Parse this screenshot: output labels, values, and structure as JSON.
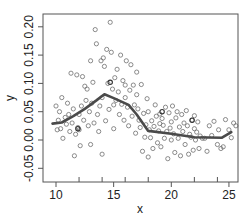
{
  "chart_data": {
    "type": "scatter",
    "title": "",
    "xlabel": "x",
    "ylabel": "y",
    "xlim": [
      9.3,
      26.2
    ],
    "ylim": [
      -0.074,
      0.223
    ],
    "grid": false,
    "legend": null,
    "x_ticks": [
      10,
      15,
      20,
      25
    ],
    "x_tick_labels": [
      "10",
      "15",
      "20",
      "25"
    ],
    "x_minor_ticks": [
      12,
      14,
      16,
      18,
      22,
      24
    ],
    "y_ticks": [
      -0.05,
      0.0,
      0.05,
      0.1,
      0.15,
      0.2
    ],
    "y_tick_labels": [
      "-0.05",
      "0.00",
      "0.05",
      "0.10",
      "0.15",
      "0.20"
    ],
    "series": [
      {
        "name": "observations",
        "kind": "scatter",
        "marker": "open-circle",
        "color": "#6e6e6e",
        "points": [
          [
            10.0,
            0.06
          ],
          [
            10.1,
            0.018
          ],
          [
            10.2,
            0.035
          ],
          [
            10.3,
            0.05
          ],
          [
            10.4,
            0.02
          ],
          [
            10.5,
            0.075
          ],
          [
            10.6,
            0.003
          ],
          [
            10.8,
            0.04
          ],
          [
            10.9,
            0.028
          ],
          [
            11.0,
            0.065
          ],
          [
            11.1,
            0.045
          ],
          [
            11.2,
            0.015
          ],
          [
            11.3,
            0.118
          ],
          [
            11.4,
            0.03
          ],
          [
            11.5,
            0.055
          ],
          [
            11.6,
            -0.028
          ],
          [
            11.7,
            0.01
          ],
          [
            11.8,
            0.115
          ],
          [
            11.9,
            0.022
          ],
          [
            12.0,
            0.045
          ],
          [
            12.0,
            0.018
          ],
          [
            12.1,
            -0.01
          ],
          [
            12.2,
            0.06
          ],
          [
            12.3,
            0.112
          ],
          [
            12.4,
            0.035
          ],
          [
            12.5,
            0.095
          ],
          [
            12.6,
            0.07
          ],
          [
            12.7,
            0.09
          ],
          [
            12.8,
            0.025
          ],
          [
            12.9,
            0.05
          ],
          [
            13.0,
            0.14
          ],
          [
            13.0,
            -0.008
          ],
          [
            13.1,
            0.065
          ],
          [
            13.2,
            0.102
          ],
          [
            13.3,
            0.03
          ],
          [
            13.4,
            0.195
          ],
          [
            13.5,
            0.17
          ],
          [
            13.6,
            0.045
          ],
          [
            13.7,
            0.015
          ],
          [
            13.8,
            0.06
          ],
          [
            13.9,
            0.14
          ],
          [
            14.0,
            -0.025
          ],
          [
            14.0,
            0.075
          ],
          [
            14.1,
            0.145
          ],
          [
            14.2,
            0.13
          ],
          [
            14.3,
            0.034
          ],
          [
            14.4,
            0.16
          ],
          [
            14.5,
            0.1
          ],
          [
            14.6,
            0.054
          ],
          [
            14.7,
            0.208
          ],
          [
            14.8,
            0.155
          ],
          [
            14.9,
            0.09
          ],
          [
            15.0,
            0.062
          ],
          [
            15.0,
            0.02
          ],
          [
            15.1,
            0.11
          ],
          [
            15.2,
            0.07
          ],
          [
            15.3,
            0.125
          ],
          [
            15.4,
            0.085
          ],
          [
            15.5,
            0.045
          ],
          [
            15.6,
            0.15
          ],
          [
            15.7,
            0.063
          ],
          [
            15.8,
            0.105
          ],
          [
            15.9,
            0.035
          ],
          [
            16.0,
            0.097
          ],
          [
            16.0,
            0.075
          ],
          [
            16.1,
            0.14
          ],
          [
            16.2,
            0.058
          ],
          [
            16.3,
            0.025
          ],
          [
            16.4,
            0.088
          ],
          [
            16.5,
            0.133
          ],
          [
            16.6,
            0.042
          ],
          [
            16.7,
            0.097
          ],
          [
            16.8,
            0.062
          ],
          [
            16.9,
            0.012
          ],
          [
            17.0,
            0.12
          ],
          [
            17.0,
            0.08
          ],
          [
            17.1,
            0.055
          ],
          [
            17.2,
            0.035
          ],
          [
            17.3,
            0.022
          ],
          [
            17.4,
            0.098
          ],
          [
            17.5,
            -0.02
          ],
          [
            17.6,
            0.047
          ],
          [
            17.7,
            0.005
          ],
          [
            17.8,
            0.027
          ],
          [
            17.9,
            0.073
          ],
          [
            18.0,
            0.05
          ],
          [
            18.0,
            -0.03
          ],
          [
            18.1,
            0.018
          ],
          [
            18.2,
            0.004
          ],
          [
            18.3,
            0.034
          ],
          [
            18.4,
            -0.015
          ],
          [
            18.5,
            0.024
          ],
          [
            18.6,
            0.062
          ],
          [
            18.7,
            0.042
          ],
          [
            18.8,
            -0.005
          ],
          [
            18.9,
            0.016
          ],
          [
            19.0,
            0.046
          ],
          [
            19.0,
            0.029
          ],
          [
            19.1,
            -0.012
          ],
          [
            19.2,
            0.038
          ],
          [
            19.3,
            0.026
          ],
          [
            19.4,
            0.003
          ],
          [
            19.5,
            0.058
          ],
          [
            19.6,
            0.015
          ],
          [
            19.7,
            -0.033
          ],
          [
            19.8,
            0.048
          ],
          [
            19.9,
            0.021
          ],
          [
            20.0,
            0.0
          ],
          [
            20.0,
            0.032
          ],
          [
            20.1,
            0.06
          ],
          [
            20.2,
            0.011
          ],
          [
            20.3,
            -0.022
          ],
          [
            20.4,
            0.039
          ],
          [
            20.5,
            0.05
          ],
          [
            20.6,
            0.003
          ],
          [
            20.7,
            0.023
          ],
          [
            20.8,
            -0.028
          ],
          [
            20.9,
            0.045
          ],
          [
            21.0,
            0.015
          ],
          [
            21.1,
            0.03
          ],
          [
            21.2,
            -0.008
          ],
          [
            21.3,
            0.052
          ],
          [
            21.4,
            0.025
          ],
          [
            21.5,
            -0.025
          ],
          [
            21.6,
            0.01
          ],
          [
            21.7,
            0.005
          ],
          [
            21.8,
            0.035
          ],
          [
            21.9,
            -0.018
          ],
          [
            22.0,
            0.02
          ],
          [
            22.0,
            0.043
          ],
          [
            22.1,
            0.0
          ],
          [
            22.2,
            0.014
          ],
          [
            22.3,
            0.032
          ],
          [
            22.4,
            -0.015
          ],
          [
            22.5,
            0.007
          ],
          [
            22.7,
            0.003
          ],
          [
            22.9,
            0.003
          ],
          [
            23.1,
            -0.02
          ],
          [
            23.3,
            0.025
          ],
          [
            23.5,
            0.008
          ],
          [
            23.7,
            0.033
          ],
          [
            24.0,
            -0.008
          ],
          [
            24.1,
            0.018
          ],
          [
            24.3,
            -0.015
          ],
          [
            24.5,
            -0.012
          ],
          [
            24.7,
            0.036
          ],
          [
            25.0,
            0.018
          ],
          [
            25.2,
            0.004
          ],
          [
            25.4,
            0.03
          ],
          [
            25.6,
            0.025
          ]
        ],
        "dark_points": [
          [
            11.9,
            0.02
          ],
          [
            14.7,
            0.102
          ],
          [
            19.2,
            0.05
          ],
          [
            21.8,
            0.035
          ]
        ]
      },
      {
        "name": "smooth fit",
        "kind": "line",
        "color": "#4a4a4a",
        "x": [
          9.7,
          10.5,
          11.5,
          12.5,
          13.5,
          14.2,
          15.0,
          16.3,
          17.0,
          18.0,
          20.0,
          22.0,
          24.4,
          25.2
        ],
        "y": [
          0.029,
          0.031,
          0.042,
          0.055,
          0.07,
          0.081,
          0.074,
          0.062,
          0.045,
          0.016,
          0.011,
          0.005,
          0.004,
          0.014
        ]
      }
    ]
  }
}
